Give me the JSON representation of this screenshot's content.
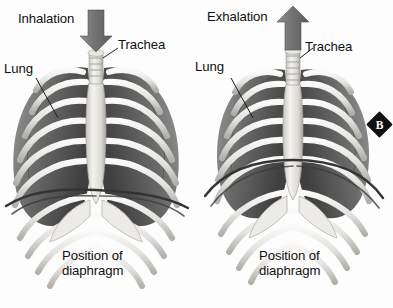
{
  "figure": {
    "panel_marker": "B",
    "background_color": "#fdfdfd",
    "ink_color": "#101010",
    "arrow_color": "#6e6e6e",
    "bone_light": "#f0efec",
    "bone_shade": "#b9b7b2",
    "lung_dark": "#5d5d5d",
    "lung_mid": "#8a8a8a",
    "diaphragm_color": "#3a3a3a"
  },
  "panels": [
    {
      "id": "inhalation",
      "phase_label": "Inhalation",
      "arrow_direction": "down",
      "arrow_meaning": "air flowing in",
      "labels": {
        "lung": "Lung",
        "trachea": "Trachea",
        "diaphragm_line1": "Position of",
        "diaphragm_line2": "diaphragm"
      },
      "diaphragm_state": "flattened and lowered"
    },
    {
      "id": "exhalation",
      "phase_label": "Exhalation",
      "arrow_direction": "up",
      "arrow_meaning": "air flowing out",
      "labels": {
        "lung": "Lung",
        "trachea": "Trachea",
        "diaphragm_line1": "Position of",
        "diaphragm_line2": "diaphragm"
      },
      "diaphragm_state": "domed and raised"
    }
  ]
}
